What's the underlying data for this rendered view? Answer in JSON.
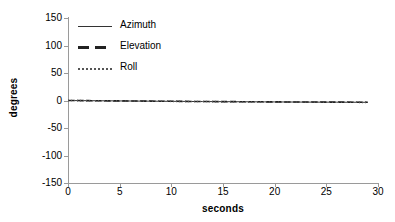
{
  "chart_data": {
    "type": "line",
    "title": "",
    "xlabel": "seconds",
    "ylabel": "degrees",
    "xlim": [
      0,
      30
    ],
    "ylim": [
      -150,
      150
    ],
    "xticks": [
      0,
      5,
      10,
      15,
      20,
      25,
      30
    ],
    "yticks": [
      150,
      100,
      50,
      0,
      -50,
      -100,
      -150
    ],
    "grid": false,
    "legend_position": "top-left-inside",
    "x": [
      0,
      1,
      2,
      3,
      4,
      5,
      6,
      7,
      8,
      9,
      10,
      11,
      12,
      13,
      14,
      15,
      16,
      17,
      18,
      19,
      20,
      21,
      22,
      23,
      24,
      25,
      26,
      27,
      28,
      29
    ],
    "series": [
      {
        "name": "Azimuth",
        "style": "solid",
        "color": "#333333",
        "values": [
          0,
          -0.2,
          -0.3,
          -0.5,
          -0.6,
          -0.8,
          -0.9,
          -1.1,
          -1.2,
          -1.4,
          -1.5,
          -1.6,
          -1.8,
          -1.9,
          -2.0,
          -2.1,
          -2.2,
          -2.3,
          -2.4,
          -2.5,
          -2.6,
          -2.7,
          -2.8,
          -2.9,
          -3.0,
          -3.0,
          -3.1,
          -3.2,
          -3.2,
          -3.3
        ]
      },
      {
        "name": "Elevation",
        "style": "dashed",
        "color": "#222222",
        "values": [
          0,
          -0.1,
          -0.3,
          -0.4,
          -0.6,
          -0.7,
          -0.9,
          -1.0,
          -1.2,
          -1.3,
          -1.4,
          -1.6,
          -1.7,
          -1.8,
          -1.9,
          -2.0,
          -2.1,
          -2.2,
          -2.3,
          -2.4,
          -2.5,
          -2.6,
          -2.7,
          -2.8,
          -2.8,
          -2.9,
          -3.0,
          -3.0,
          -3.1,
          -3.1
        ]
      },
      {
        "name": "Roll",
        "style": "dotted",
        "color": "#555555",
        "values": [
          0,
          -0.2,
          -0.4,
          -0.5,
          -0.7,
          -0.8,
          -1.0,
          -1.1,
          -1.3,
          -1.4,
          -1.5,
          -1.7,
          -1.8,
          -1.9,
          -2.0,
          -2.2,
          -2.3,
          -2.4,
          -2.5,
          -2.6,
          -2.7,
          -2.7,
          -2.8,
          -2.9,
          -3.0,
          -3.1,
          -3.1,
          -3.2,
          -3.3,
          -3.4
        ]
      }
    ]
  },
  "axis": {
    "line_color": "#9a9a9a"
  }
}
